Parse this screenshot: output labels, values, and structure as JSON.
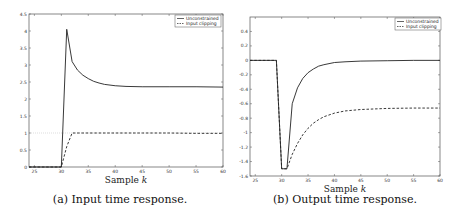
{
  "chart_data": [
    {
      "type": "line",
      "id": "a",
      "title": "",
      "caption": "(a) Input time response.",
      "xlabel": "Sample k",
      "ylabel": "",
      "xlim": [
        24,
        60
      ],
      "ylim": [
        0,
        4.5
      ],
      "xticks": [
        25,
        30,
        35,
        40,
        45,
        50,
        55,
        60
      ],
      "yticks": [
        0,
        0.5,
        1,
        1.5,
        2,
        2.5,
        3,
        3.5,
        4,
        4.5
      ],
      "ytick_labels": [
        "0",
        "0.5",
        "1",
        "1.5",
        "2",
        "2.5",
        "3",
        "3.5",
        "4",
        "4.5"
      ],
      "grid": false,
      "legend_position": "top-right",
      "reference_line": {
        "y": 1,
        "style": "dotted",
        "color": "#bbbbbb"
      },
      "series": [
        {
          "name": "Unconstrained",
          "style": "solid",
          "x": [
            24,
            30,
            31,
            32,
            33,
            34,
            35,
            36,
            37,
            38,
            40,
            42,
            45,
            50,
            55,
            60
          ],
          "y": [
            0,
            0,
            4.05,
            3.1,
            2.85,
            2.7,
            2.6,
            2.52,
            2.47,
            2.43,
            2.39,
            2.37,
            2.36,
            2.36,
            2.36,
            2.35
          ]
        },
        {
          "name": "Input clipping",
          "style": "dashed",
          "x": [
            24,
            30,
            31,
            32,
            35,
            40,
            45,
            50,
            55,
            60
          ],
          "y": [
            0,
            0,
            0.6,
            1.0,
            1.0,
            1.0,
            1.0,
            1.0,
            0.99,
            0.99
          ]
        }
      ]
    },
    {
      "type": "line",
      "id": "b",
      "title": "",
      "caption": "(b) Output time response.",
      "xlabel": "Sample k",
      "ylabel": "",
      "xlim": [
        24,
        60
      ],
      "ylim": [
        -1.6,
        0.6
      ],
      "xticks": [
        25,
        30,
        35,
        40,
        45,
        50,
        55,
        60
      ],
      "yticks": [
        -1.6,
        -1.4,
        -1.2,
        -1,
        -0.8,
        -0.6,
        -0.4,
        -0.2,
        0,
        0.2,
        0.4
      ],
      "ytick_labels": [
        "-1.6",
        "-1.4",
        "-1.2",
        "-1",
        "-0.8",
        "-0.6",
        "-0.4",
        "-0.2",
        "0",
        "0.2",
        "0.4"
      ],
      "grid": false,
      "legend_position": "top-right",
      "series": [
        {
          "name": "Unconstrained",
          "style": "solid",
          "x": [
            24,
            29,
            30,
            31,
            32,
            33,
            34,
            35,
            36,
            37,
            38,
            40,
            42,
            45,
            50,
            55,
            60
          ],
          "y": [
            0,
            0,
            -1.5,
            -1.5,
            -0.6,
            -0.38,
            -0.25,
            -0.17,
            -0.12,
            -0.08,
            -0.06,
            -0.03,
            -0.02,
            -0.01,
            -0.005,
            0,
            0
          ]
        },
        {
          "name": "Input clipping",
          "style": "dashed",
          "x": [
            24,
            29,
            30,
            31,
            32,
            33,
            34,
            35,
            36,
            37,
            38,
            40,
            42,
            45,
            50,
            55,
            60
          ],
          "y": [
            0,
            0,
            -1.5,
            -1.5,
            -1.3,
            -1.15,
            -1.03,
            -0.94,
            -0.87,
            -0.82,
            -0.78,
            -0.73,
            -0.7,
            -0.68,
            -0.665,
            -0.66,
            -0.66
          ]
        }
      ]
    }
  ]
}
